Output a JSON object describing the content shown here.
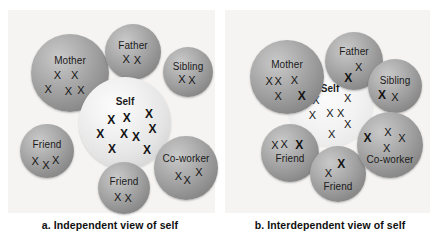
{
  "figure": {
    "background_color": "#ffffff",
    "panel_background_color": "#f5f4f2",
    "sphere_color": "#9b9b9b",
    "self_color_a": "#e9e9e9",
    "self_color_b": "#f2f2f2",
    "mark_color": "#141414"
  },
  "panels": [
    {
      "id": "a",
      "caption": "a. Independent view of self",
      "self": {
        "label": "Self",
        "marks": [
          {
            "style": "bold",
            "x": 35,
            "y": 47
          },
          {
            "style": "bold",
            "x": 52,
            "y": 45
          },
          {
            "style": "bold",
            "x": 76,
            "y": 40
          },
          {
            "style": "bold",
            "x": 23,
            "y": 62
          },
          {
            "style": "bold",
            "x": 49,
            "y": 62
          },
          {
            "style": "bold",
            "x": 62,
            "y": 65
          },
          {
            "style": "bold",
            "x": 80,
            "y": 57
          },
          {
            "style": "bold",
            "x": 36,
            "y": 78
          },
          {
            "style": "bold",
            "x": 74,
            "y": 79
          }
        ]
      },
      "nodes": [
        {
          "label": "Mother",
          "marks": [
            {
              "style": "thin",
              "x": 34,
              "y": 52
            },
            {
              "style": "thin",
              "x": 56,
              "y": 52
            },
            {
              "style": "thin",
              "x": 22,
              "y": 70
            },
            {
              "style": "thin",
              "x": 48,
              "y": 73
            },
            {
              "style": "thin",
              "x": 64,
              "y": 72
            }
          ]
        },
        {
          "label": "Father",
          "marks": [
            {
              "style": "thin",
              "x": 38,
              "y": 63
            },
            {
              "style": "thin",
              "x": 58,
              "y": 64
            }
          ]
        },
        {
          "label": "Sibling",
          "marks": [
            {
              "style": "thin",
              "x": 38,
              "y": 64
            },
            {
              "style": "thin",
              "x": 58,
              "y": 66
            }
          ]
        },
        {
          "label": "Friend",
          "marks": [
            {
              "style": "thin",
              "x": 28,
              "y": 68
            },
            {
              "style": "thin",
              "x": 48,
              "y": 76
            },
            {
              "style": "thin",
              "x": 66,
              "y": 66
            }
          ]
        },
        {
          "label": "Friend",
          "marks": [
            {
              "style": "thin",
              "x": 38,
              "y": 67
            },
            {
              "style": "thin",
              "x": 58,
              "y": 69
            }
          ]
        },
        {
          "label": "Co-worker",
          "marks": [
            {
              "style": "thin",
              "x": 38,
              "y": 63
            },
            {
              "style": "thin",
              "x": 52,
              "y": 68
            },
            {
              "style": "thin",
              "x": 70,
              "y": 56
            }
          ]
        }
      ]
    },
    {
      "id": "b",
      "caption": "b. Interdependent view of self",
      "self": {
        "label": "Self",
        "marks": [
          {
            "style": "thin",
            "x": 34,
            "y": 45
          },
          {
            "style": "thin",
            "x": 70,
            "y": 43
          },
          {
            "style": "thin",
            "x": 30,
            "y": 62
          },
          {
            "style": "thin",
            "x": 50,
            "y": 60
          },
          {
            "style": "thin",
            "x": 62,
            "y": 60
          },
          {
            "style": "thin",
            "x": 70,
            "y": 73
          },
          {
            "style": "thin",
            "x": 52,
            "y": 84
          }
        ]
      },
      "nodes": [
        {
          "label": "Mother",
          "marks": [
            {
              "style": "thin",
              "x": 26,
              "y": 56
            },
            {
              "style": "thin",
              "x": 38,
              "y": 56
            },
            {
              "style": "thin",
              "x": 60,
              "y": 54
            },
            {
              "style": "thin",
              "x": 38,
              "y": 76
            },
            {
              "style": "bold",
              "x": 68,
              "y": 76
            }
          ]
        },
        {
          "label": "Father",
          "marks": [
            {
              "style": "thin",
              "x": 58,
              "y": 62
            },
            {
              "style": "bold",
              "x": 40,
              "y": 79
            }
          ]
        },
        {
          "label": "Sibling",
          "marks": [
            {
              "style": "bold",
              "x": 26,
              "y": 66
            },
            {
              "style": "thin",
              "x": 50,
              "y": 70
            }
          ]
        },
        {
          "label": "Friend",
          "marks": [
            {
              "style": "thin",
              "x": 24,
              "y": 36
            },
            {
              "style": "thin",
              "x": 40,
              "y": 34
            },
            {
              "style": "bold",
              "x": 66,
              "y": 36
            }
          ]
        },
        {
          "label": "Friend",
          "marks": [
            {
              "style": "bold",
              "x": 56,
              "y": 32
            },
            {
              "style": "thin",
              "x": 33,
              "y": 48
            }
          ]
        },
        {
          "label": "Co-worker",
          "marks": [
            {
              "style": "bold",
              "x": 16,
              "y": 40
            },
            {
              "style": "thin",
              "x": 47,
              "y": 30
            },
            {
              "style": "thin",
              "x": 68,
              "y": 40
            },
            {
              "style": "thin",
              "x": 45,
              "y": 54
            }
          ]
        }
      ]
    }
  ]
}
